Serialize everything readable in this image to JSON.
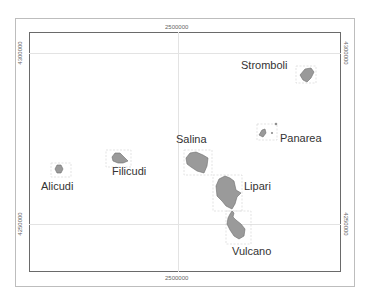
{
  "map": {
    "title": "Aeolian Islands",
    "grid": {
      "x_labels": {
        "top": "2500000",
        "bottom": "2500000"
      },
      "y_labels": {
        "upper_left": "4300000",
        "upper_right": "4300000",
        "lower_left": "4250000",
        "lower_right": "4250000"
      }
    },
    "colors": {
      "island_fill": "#9a9a9a",
      "island_stroke": "#6d6d6d",
      "frame": "#6a6a6a",
      "grid": "#e3e3e3"
    },
    "islands": [
      {
        "name": "Stromboli"
      },
      {
        "name": "Panarea"
      },
      {
        "name": "Salina"
      },
      {
        "name": "Lipari"
      },
      {
        "name": "Vulcano"
      },
      {
        "name": "Filicudi"
      },
      {
        "name": "Alicudi"
      }
    ]
  }
}
